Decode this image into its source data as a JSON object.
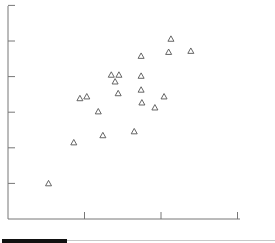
{
  "chart_data": {
    "type": "scatter",
    "title": "",
    "xlabel": "",
    "ylabel": "",
    "marker": "open-triangle",
    "marker_color": "#555555",
    "axis_color": "#777777",
    "grid": false,
    "legend": null,
    "xlim": [
      0,
      3
    ],
    "ylim": [
      0,
      6
    ],
    "x_ticks": [
      1,
      2,
      3
    ],
    "y_ticks": [
      1,
      2,
      3,
      4,
      5,
      6
    ],
    "x_tick_labels": [],
    "y_tick_labels": [],
    "points": [
      {
        "x": 0.53,
        "y": 1.0
      },
      {
        "x": 0.86,
        "y": 2.15
      },
      {
        "x": 0.94,
        "y": 3.39
      },
      {
        "x": 1.03,
        "y": 3.44
      },
      {
        "x": 1.18,
        "y": 3.02
      },
      {
        "x": 1.24,
        "y": 2.35
      },
      {
        "x": 1.35,
        "y": 4.05
      },
      {
        "x": 1.4,
        "y": 3.86
      },
      {
        "x": 1.45,
        "y": 4.05
      },
      {
        "x": 1.44,
        "y": 3.53
      },
      {
        "x": 1.65,
        "y": 2.46
      },
      {
        "x": 1.74,
        "y": 4.58
      },
      {
        "x": 1.74,
        "y": 4.02
      },
      {
        "x": 1.74,
        "y": 3.63
      },
      {
        "x": 1.75,
        "y": 3.27
      },
      {
        "x": 1.92,
        "y": 3.13
      },
      {
        "x": 2.04,
        "y": 3.44
      },
      {
        "x": 2.1,
        "y": 4.69
      },
      {
        "x": 2.13,
        "y": 5.06
      },
      {
        "x": 2.39,
        "y": 4.72
      }
    ]
  },
  "plot_px": {
    "origin_x": 8,
    "origin_y": 219,
    "x_unit": 76.5,
    "y_unit": 35.6,
    "x_end": 240,
    "y_top": 6
  }
}
